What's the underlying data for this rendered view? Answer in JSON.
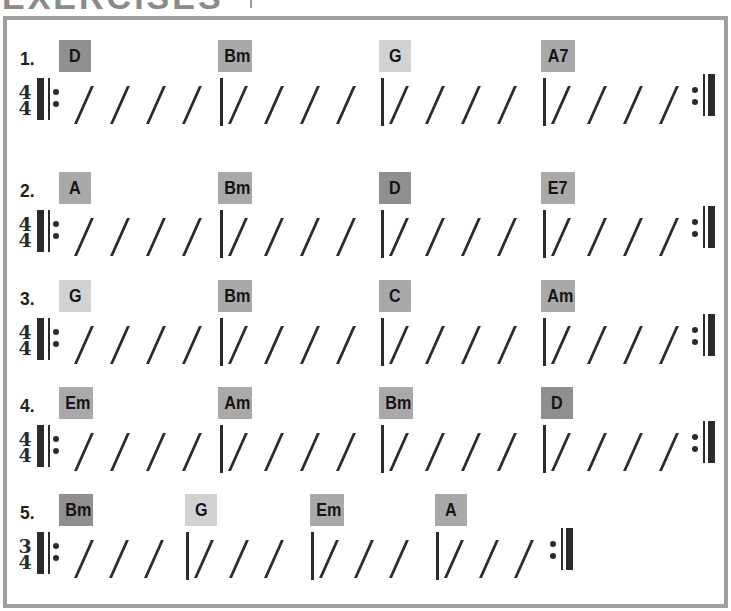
{
  "page": {
    "title": "EXERCISES",
    "title_partially_visible": true
  },
  "colors": {
    "frame_border": "#a0a0a0",
    "chord_dark": "#8f8f8f",
    "chord_medium": "#a9a9a9",
    "chord_light": "#d2d2d2",
    "ink": "#2b2b2b"
  },
  "exercises": [
    {
      "number": "1.",
      "time_signature": {
        "top": "4",
        "bottom": "4"
      },
      "beats_per_measure": 4,
      "repeat": true,
      "chords": [
        {
          "name": "D",
          "shade": "dark"
        },
        {
          "name": "Bm",
          "shade": "medium"
        },
        {
          "name": "G",
          "shade": "light"
        },
        {
          "name": "A7",
          "shade": "medium"
        }
      ]
    },
    {
      "number": "2.",
      "time_signature": {
        "top": "4",
        "bottom": "4"
      },
      "beats_per_measure": 4,
      "repeat": true,
      "chords": [
        {
          "name": "A",
          "shade": "medium"
        },
        {
          "name": "Bm",
          "shade": "medium"
        },
        {
          "name": "D",
          "shade": "dark"
        },
        {
          "name": "E7",
          "shade": "medium"
        }
      ]
    },
    {
      "number": "3.",
      "time_signature": {
        "top": "4",
        "bottom": "4"
      },
      "beats_per_measure": 4,
      "repeat": true,
      "chords": [
        {
          "name": "G",
          "shade": "light"
        },
        {
          "name": "Bm",
          "shade": "medium"
        },
        {
          "name": "C",
          "shade": "medium"
        },
        {
          "name": "Am",
          "shade": "medium"
        }
      ]
    },
    {
      "number": "4.",
      "time_signature": {
        "top": "4",
        "bottom": "4"
      },
      "beats_per_measure": 4,
      "repeat": true,
      "chords": [
        {
          "name": "Em",
          "shade": "medium"
        },
        {
          "name": "Am",
          "shade": "medium"
        },
        {
          "name": "Bm",
          "shade": "medium"
        },
        {
          "name": "D",
          "shade": "dark"
        }
      ]
    },
    {
      "number": "5.",
      "time_signature": {
        "top": "3",
        "bottom": "4"
      },
      "beats_per_measure": 3,
      "repeat": true,
      "chords": [
        {
          "name": "Bm",
          "shade": "dark"
        },
        {
          "name": "G",
          "shade": "light"
        },
        {
          "name": "Em",
          "shade": "medium"
        },
        {
          "name": "A",
          "shade": "medium"
        }
      ]
    }
  ]
}
